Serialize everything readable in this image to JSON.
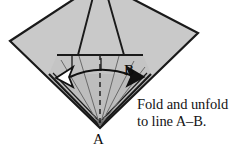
{
  "figure": {
    "colors": {
      "paper_fill": "#c9c9c9",
      "paper_fill_shaded": "#bdbdbd",
      "paper_fill_dark": "#b0b0b0",
      "outline": "#1a1a1a",
      "fold_line": "#5a5a5a",
      "dashed_line": "#2b2b2b",
      "arrow_fill_hollow": "#ffffff",
      "arrow_fill_solid": "#111111",
      "background": "#ffffff",
      "text": "#141414"
    },
    "labels": {
      "vertex_a": "A",
      "vertex_b": "B"
    },
    "caption": {
      "line1": "Fold and unfold",
      "line2": "to line A–B."
    },
    "geometry": {
      "kite_points": "10,41 100,-18 198,33 100,128",
      "flap_points": "78,55 100,-30 124,55",
      "lower_triangle_points": "49,74 151,74 100,126",
      "band_points": "57,55 143,55 151,74 49,74",
      "horizontal_line": {
        "x1": 57,
        "y1": 55,
        "x2": 143,
        "y2": 55
      },
      "dashed_center": {
        "x1": 100,
        "y1": 55,
        "x2": 100,
        "y2": 126
      },
      "fold_rays": [
        {
          "x1": 100,
          "y1": 126,
          "x2": 61,
          "y2": 60
        },
        {
          "x1": 100,
          "y1": 126,
          "x2": 78,
          "y2": 56
        },
        {
          "x1": 100,
          "y1": 126,
          "x2": 118,
          "y2": 56
        },
        {
          "x1": 100,
          "y1": 126,
          "x2": 133,
          "y2": 60
        },
        {
          "x1": 100,
          "y1": 126,
          "x2": 144,
          "y2": 66
        }
      ],
      "arrow_curve": "M 64,76 Q 100,62 136,75",
      "arrowhead_left": "72,68 58,77 72,85 68,77",
      "arrowhead_right": "128,67 142,76 128,84 132,76"
    }
  }
}
